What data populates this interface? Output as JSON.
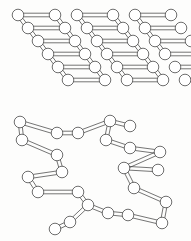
{
  "figure": {
    "background_color": "#fdfdfc",
    "node_fill": "#ffffff",
    "node_stroke": "#4a4a4a",
    "bond_stroke": "#3a3a3a",
    "node_radius": 5.8,
    "bond_gap": 3.6,
    "width": 191,
    "height": 241
  },
  "panels": [
    {
      "id": "crystalline-region",
      "label": "crystalline ordered lattice",
      "description": "Parallel rows of linked spheres forming a sheared parallelogram lattice",
      "rows": [
        {
          "y": 15,
          "x_start": 18,
          "segments": [
            [
              18,
              55
            ],
            [
              77,
              113
            ],
            [
              135,
              171
            ]
          ]
        },
        {
          "y": 28,
          "x_start": 28,
          "segments": [
            [
              28,
              65
            ],
            [
              87,
              123
            ],
            [
              145,
              181
            ]
          ]
        },
        {
          "y": 41,
          "x_start": 38,
          "segments": [
            [
              38,
              75
            ],
            [
              97,
              133
            ],
            [
              155,
              191
            ]
          ]
        },
        {
          "y": 54,
          "x_start": 48,
          "segments": [
            [
              48,
              85
            ],
            [
              107,
              143
            ],
            [
              165,
              201
            ]
          ]
        },
        {
          "y": 67,
          "x_start": 58,
          "segments": [
            [
              58,
              95
            ],
            [
              117,
              153
            ],
            [
              175,
              211
            ]
          ]
        },
        {
          "y": 80,
          "x_start": 68,
          "segments": [
            [
              68,
              105
            ],
            [
              127,
              163
            ],
            [
              185,
              221
            ]
          ]
        }
      ],
      "vertical_links": [
        [
          18,
          15,
          28,
          28
        ],
        [
          55,
          15,
          65,
          28
        ],
        [
          77,
          15,
          87,
          28
        ],
        [
          113,
          15,
          123,
          28
        ],
        [
          135,
          15,
          145,
          28
        ],
        [
          28,
          28,
          38,
          41
        ],
        [
          65,
          28,
          75,
          41
        ],
        [
          87,
          28,
          97,
          41
        ],
        [
          123,
          28,
          133,
          41
        ],
        [
          145,
          28,
          155,
          41
        ],
        [
          38,
          41,
          48,
          54
        ],
        [
          75,
          41,
          85,
          54
        ],
        [
          97,
          41,
          107,
          54
        ],
        [
          133,
          41,
          143,
          54
        ],
        [
          155,
          41,
          165,
          54
        ],
        [
          48,
          54,
          58,
          67
        ],
        [
          85,
          54,
          95,
          67
        ],
        [
          107,
          54,
          117,
          67
        ],
        [
          143,
          54,
          153,
          67
        ],
        [
          58,
          67,
          68,
          80
        ],
        [
          95,
          67,
          105,
          80
        ],
        [
          117,
          67,
          127,
          80
        ],
        [
          153,
          67,
          163,
          80
        ]
      ]
    },
    {
      "id": "amorphous-region",
      "label": "amorphous disordered chains",
      "description": "Randomly oriented linked spheres forming tangled chains",
      "chains": [
        {
          "id": "chain-a",
          "points": [
            [
              20,
              122
            ],
            [
              57,
              133
            ],
            [
              78,
              133
            ],
            [
              110,
              121
            ],
            [
              130,
              126
            ]
          ]
        },
        {
          "id": "chain-b",
          "points": [
            [
              20,
              122
            ],
            [
              22,
              140
            ],
            [
              57,
              155
            ],
            [
              62,
              172
            ]
          ]
        },
        {
          "id": "chain-c",
          "points": [
            [
              62,
              172
            ],
            [
              28,
              177
            ],
            [
              38,
              192
            ],
            [
              78,
              192
            ],
            [
              88,
              205
            ]
          ]
        },
        {
          "id": "chain-d",
          "points": [
            [
              88,
              205
            ],
            [
              70,
              222
            ],
            [
              55,
              229
            ]
          ]
        },
        {
          "id": "chain-e",
          "points": [
            [
              110,
              121
            ],
            [
              106,
              140
            ],
            [
              130,
              148
            ],
            [
              160,
              152
            ]
          ]
        },
        {
          "id": "chain-f",
          "points": [
            [
              160,
              152
            ],
            [
              124,
              168
            ],
            [
              158,
              170
            ]
          ]
        },
        {
          "id": "chain-g",
          "points": [
            [
              124,
              168
            ],
            [
              134,
              188
            ],
            [
              166,
              202
            ],
            [
              162,
              223
            ]
          ]
        },
        {
          "id": "chain-h",
          "points": [
            [
              162,
              223
            ],
            [
              128,
              215
            ],
            [
              108,
              213
            ],
            [
              88,
              205
            ]
          ]
        }
      ]
    }
  ]
}
